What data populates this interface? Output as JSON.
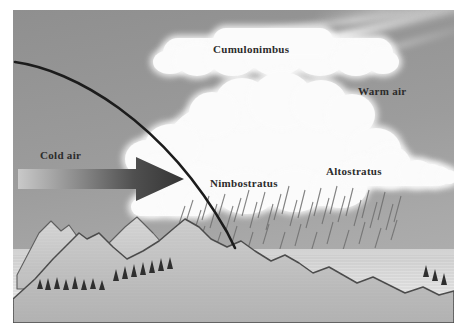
{
  "figure": {
    "kind": "weather-front-diagram",
    "title_visible": false
  },
  "labels": {
    "cumulonimbus": "Cumulonimbus",
    "warm_air": "Warm air",
    "cold_air": "Cold air",
    "nimbostratus": "Nimbostratus",
    "altostratus": "Altostratus"
  },
  "elements": {
    "cold_air_arrow": "cold-air-arrow",
    "frontal_boundary": "frontal-boundary-line",
    "precipitation": "precipitation-streaks",
    "anvil_cloud": "cumulonimbus-anvil",
    "tower_cloud": "cumulonimbus-tower",
    "altostratus_deck": "altostratus-cloud-deck",
    "mountains_back": "background-mountain-range",
    "mountains_front": "foreground-mountain-ridge",
    "trees": "conifer-trees",
    "sun_rays": "cirrus-light-rays"
  },
  "colors": {
    "sky": "#9b9b9b",
    "sky_light": "#b4b4b4",
    "cloud": "#fbfbfb",
    "ink": "#2c2c2c",
    "arrow_dark": "#3a3a3a",
    "arrow_light": "#c9c9c9",
    "ground_light": "#e8e8e8",
    "ridge_line": "#4a4a4a",
    "rain": "#6b6b6b",
    "frame": "#ffffff"
  }
}
